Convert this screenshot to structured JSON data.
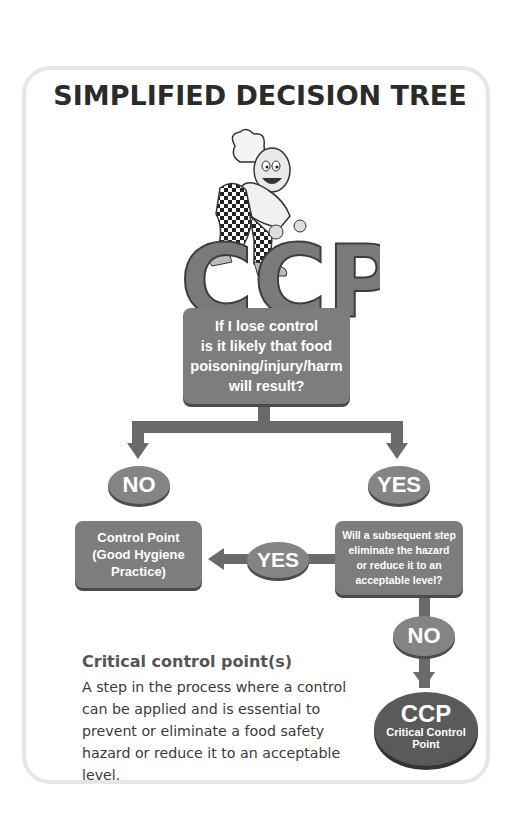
{
  "title": "SIMPLIFIED DECISION TREE",
  "mascot": {
    "icon": "chef-mascot-icon",
    "logo_text": "CCP"
  },
  "question_box": {
    "lines": [
      "If I lose control",
      "is it likely that food",
      "poisoning/injury/harm",
      "will result?"
    ]
  },
  "branches": {
    "left_label": "NO",
    "right_label": "YES"
  },
  "control_point_box": {
    "lines": [
      "Control Point",
      "(Good Hygiene",
      "Practice)"
    ]
  },
  "yes_connector_label": "YES",
  "subsequent_step_box": {
    "lines": [
      "Will a subsequent step",
      "eliminate the hazard",
      "or reduce it to an",
      "acceptable level?"
    ]
  },
  "no_connector_label": "NO",
  "ccp_result": {
    "abbrev": "CCP",
    "lines": [
      "Critical Control",
      "Point"
    ]
  },
  "definition": {
    "heading": "Critical control point(s)",
    "body": "A step in the process where a control can be applied and is essential to prevent or eliminate a food safety hazard or reduce it to an acceptable level."
  },
  "colors": {
    "box_fill": "#7d7d7d",
    "oval_fill": "#848484",
    "arrow": "#6a6a6a",
    "ccp_fill": "#5a5a5a",
    "card_border": "#e6e6e6",
    "title_text": "#2b2b2b"
  }
}
